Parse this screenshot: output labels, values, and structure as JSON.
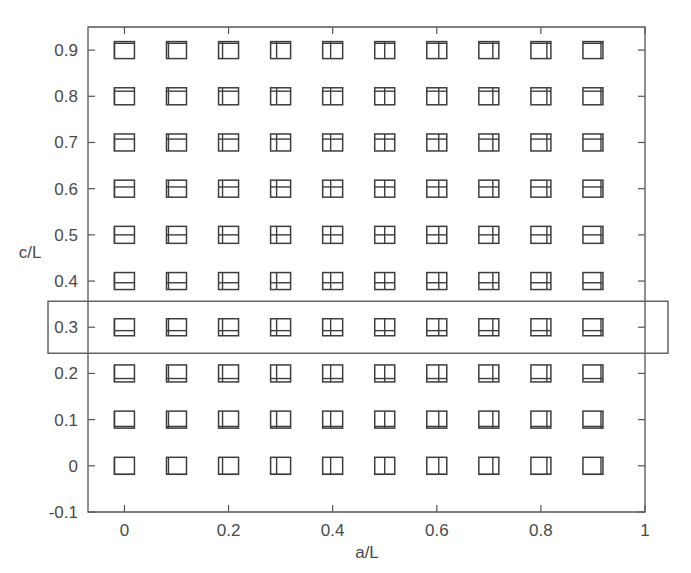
{
  "chart_data": {
    "type": "scatter",
    "title": "",
    "xlabel": "a/L",
    "ylabel": "c/L",
    "xlim": [
      -0.07,
      1.0
    ],
    "ylim": [
      -0.1,
      0.95
    ],
    "xticks": [
      0,
      0.2,
      0.4,
      0.6,
      0.8,
      1
    ],
    "xticklabels": [
      "0",
      "0.2",
      "0.4",
      "0.6",
      "0.8",
      "1"
    ],
    "yticks": [
      -0.1,
      0,
      0.1,
      0.2,
      0.3,
      0.4,
      0.5,
      0.6,
      0.7,
      0.8,
      0.9
    ],
    "yticklabels": [
      "-0.1",
      "0",
      "0.1",
      "0.2",
      "0.3",
      "0.4",
      "0.5",
      "0.6",
      "0.7",
      "0.8",
      "0.9"
    ],
    "grid": false,
    "legend": null,
    "marker_style": "square-with-internal-crack-lines",
    "marker_description": "Each data point is drawn as an open square glyph containing a horizontal internal line whose height within the square equals c/L, and a vertical internal line whose horizontal position within the square equals a/L.",
    "x": [
      0,
      0.1,
      0.2,
      0.3,
      0.4,
      0.5,
      0.6,
      0.7,
      0.8,
      0.9
    ],
    "y": [
      0,
      0.1,
      0.2,
      0.3,
      0.4,
      0.5,
      0.6,
      0.7,
      0.8,
      0.9
    ],
    "points": [
      {
        "x": 0,
        "y": 0.9
      },
      {
        "x": 0.1,
        "y": 0.9
      },
      {
        "x": 0.2,
        "y": 0.9
      },
      {
        "x": 0.3,
        "y": 0.9
      },
      {
        "x": 0.4,
        "y": 0.9
      },
      {
        "x": 0.5,
        "y": 0.9
      },
      {
        "x": 0.6,
        "y": 0.9
      },
      {
        "x": 0.7,
        "y": 0.9
      },
      {
        "x": 0.8,
        "y": 0.9
      },
      {
        "x": 0.9,
        "y": 0.9
      },
      {
        "x": 0,
        "y": 0.8
      },
      {
        "x": 0.1,
        "y": 0.8
      },
      {
        "x": 0.2,
        "y": 0.8
      },
      {
        "x": 0.3,
        "y": 0.8
      },
      {
        "x": 0.4,
        "y": 0.8
      },
      {
        "x": 0.5,
        "y": 0.8
      },
      {
        "x": 0.6,
        "y": 0.8
      },
      {
        "x": 0.7,
        "y": 0.8
      },
      {
        "x": 0.8,
        "y": 0.8
      },
      {
        "x": 0.9,
        "y": 0.8
      },
      {
        "x": 0,
        "y": 0.7
      },
      {
        "x": 0.1,
        "y": 0.7
      },
      {
        "x": 0.2,
        "y": 0.7
      },
      {
        "x": 0.3,
        "y": 0.7
      },
      {
        "x": 0.4,
        "y": 0.7
      },
      {
        "x": 0.5,
        "y": 0.7
      },
      {
        "x": 0.6,
        "y": 0.7
      },
      {
        "x": 0.7,
        "y": 0.7
      },
      {
        "x": 0.8,
        "y": 0.7
      },
      {
        "x": 0.9,
        "y": 0.7
      },
      {
        "x": 0,
        "y": 0.6
      },
      {
        "x": 0.1,
        "y": 0.6
      },
      {
        "x": 0.2,
        "y": 0.6
      },
      {
        "x": 0.3,
        "y": 0.6
      },
      {
        "x": 0.4,
        "y": 0.6
      },
      {
        "x": 0.5,
        "y": 0.6
      },
      {
        "x": 0.6,
        "y": 0.6
      },
      {
        "x": 0.7,
        "y": 0.6
      },
      {
        "x": 0.8,
        "y": 0.6
      },
      {
        "x": 0.9,
        "y": 0.6
      },
      {
        "x": 0,
        "y": 0.5
      },
      {
        "x": 0.1,
        "y": 0.5
      },
      {
        "x": 0.2,
        "y": 0.5
      },
      {
        "x": 0.3,
        "y": 0.5
      },
      {
        "x": 0.4,
        "y": 0.5
      },
      {
        "x": 0.5,
        "y": 0.5
      },
      {
        "x": 0.6,
        "y": 0.5
      },
      {
        "x": 0.7,
        "y": 0.5
      },
      {
        "x": 0.8,
        "y": 0.5
      },
      {
        "x": 0.9,
        "y": 0.5
      },
      {
        "x": 0,
        "y": 0.4
      },
      {
        "x": 0.1,
        "y": 0.4
      },
      {
        "x": 0.2,
        "y": 0.4
      },
      {
        "x": 0.3,
        "y": 0.4
      },
      {
        "x": 0.4,
        "y": 0.4
      },
      {
        "x": 0.5,
        "y": 0.4
      },
      {
        "x": 0.6,
        "y": 0.4
      },
      {
        "x": 0.7,
        "y": 0.4
      },
      {
        "x": 0.8,
        "y": 0.4
      },
      {
        "x": 0.9,
        "y": 0.4
      },
      {
        "x": 0,
        "y": 0.3
      },
      {
        "x": 0.1,
        "y": 0.3
      },
      {
        "x": 0.2,
        "y": 0.3
      },
      {
        "x": 0.3,
        "y": 0.3
      },
      {
        "x": 0.4,
        "y": 0.3
      },
      {
        "x": 0.5,
        "y": 0.3
      },
      {
        "x": 0.6,
        "y": 0.3
      },
      {
        "x": 0.7,
        "y": 0.3
      },
      {
        "x": 0.8,
        "y": 0.3
      },
      {
        "x": 0.9,
        "y": 0.3
      },
      {
        "x": 0,
        "y": 0.2
      },
      {
        "x": 0.1,
        "y": 0.2
      },
      {
        "x": 0.2,
        "y": 0.2
      },
      {
        "x": 0.3,
        "y": 0.2
      },
      {
        "x": 0.4,
        "y": 0.2
      },
      {
        "x": 0.5,
        "y": 0.2
      },
      {
        "x": 0.6,
        "y": 0.2
      },
      {
        "x": 0.7,
        "y": 0.2
      },
      {
        "x": 0.8,
        "y": 0.2
      },
      {
        "x": 0.9,
        "y": 0.2
      },
      {
        "x": 0,
        "y": 0.1
      },
      {
        "x": 0.1,
        "y": 0.1
      },
      {
        "x": 0.2,
        "y": 0.1
      },
      {
        "x": 0.3,
        "y": 0.1
      },
      {
        "x": 0.4,
        "y": 0.1
      },
      {
        "x": 0.5,
        "y": 0.1
      },
      {
        "x": 0.6,
        "y": 0.1
      },
      {
        "x": 0.7,
        "y": 0.1
      },
      {
        "x": 0.8,
        "y": 0.1
      },
      {
        "x": 0.9,
        "y": 0.1
      },
      {
        "x": 0,
        "y": 0
      },
      {
        "x": 0.1,
        "y": 0
      },
      {
        "x": 0.2,
        "y": 0
      },
      {
        "x": 0.3,
        "y": 0
      },
      {
        "x": 0.4,
        "y": 0
      },
      {
        "x": 0.5,
        "y": 0
      },
      {
        "x": 0.6,
        "y": 0
      },
      {
        "x": 0.7,
        "y": 0
      },
      {
        "x": 0.8,
        "y": 0
      },
      {
        "x": 0.9,
        "y": 0
      }
    ],
    "annotations": [
      {
        "type": "rectangle",
        "label": "highlight-row-c-over-L-0.3",
        "row_value": 0.3,
        "description": "Rectangular outline highlighting the entire c/L = 0.3 row of markers, extending left to enclose the 0.3 tick label and right beyond the plot frame."
      }
    ]
  },
  "colors": {
    "background": "#ffffff",
    "axis": "#555555",
    "tick_text": "#4a4a4a",
    "marker": "#3d3d3d",
    "highlight": "#5a5a5a"
  }
}
